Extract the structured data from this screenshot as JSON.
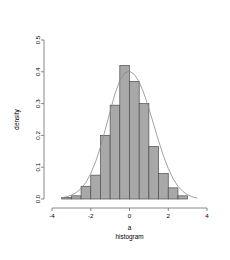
{
  "chart_data": {
    "type": "bar",
    "title": "Normal distribution",
    "subtitle": "",
    "xlabel": "a\nhistogram",
    "xlabel_lines": [
      "a",
      "histogram"
    ],
    "ylabel": "density",
    "xlim": [
      -4,
      4
    ],
    "ylim": [
      0.0,
      0.5
    ],
    "grid": false,
    "legend": false,
    "bin_width": 0.5,
    "bin_edges": [
      -3.5,
      -3.0,
      -2.5,
      -2.0,
      -1.5,
      -1.0,
      -0.5,
      0.0,
      0.5,
      1.0,
      1.5,
      2.0,
      2.5,
      3.0
    ],
    "categories": [
      "-3.5--3.0",
      "-3.0--2.5",
      "-2.5--2.0",
      "-2.0--1.5",
      "-1.5--1.0",
      "-1.0--0.5",
      "-0.5-0.0",
      "0.0-0.5",
      "0.5-1.0",
      "1.0-1.5",
      "1.5-2.0",
      "2.0-2.5",
      "2.5-3.0"
    ],
    "values": [
      0.005,
      0.01,
      0.04,
      0.075,
      0.2,
      0.295,
      0.42,
      0.37,
      0.3,
      0.165,
      0.08,
      0.035,
      0.01
    ],
    "x_ticks": [
      -4,
      -2,
      0,
      2,
      4
    ],
    "x_tick_labels": [
      "-4",
      "-2",
      "0",
      "2",
      "4"
    ],
    "y_ticks": [
      0.0,
      0.1,
      0.2,
      0.3,
      0.4,
      0.5
    ],
    "y_tick_labels": [
      "0.0",
      "0.1",
      "0.2",
      "0.3",
      "0.4",
      "0.5"
    ],
    "overlay": {
      "name": "density curve",
      "type": "line",
      "x": [
        -3.5,
        -3.25,
        -3.0,
        -2.75,
        -2.5,
        -2.25,
        -2.0,
        -1.75,
        -1.5,
        -1.25,
        -1.0,
        -0.75,
        -0.5,
        -0.25,
        0.0,
        0.25,
        0.5,
        0.75,
        1.0,
        1.25,
        1.5,
        1.75,
        2.0,
        2.25,
        2.5,
        2.75,
        3.0,
        3.25,
        3.5
      ],
      "y": [
        0.004,
        0.007,
        0.012,
        0.02,
        0.033,
        0.052,
        0.08,
        0.117,
        0.163,
        0.218,
        0.276,
        0.331,
        0.372,
        0.397,
        0.402,
        0.392,
        0.368,
        0.331,
        0.285,
        0.234,
        0.183,
        0.136,
        0.096,
        0.064,
        0.04,
        0.024,
        0.013,
        0.007,
        0.003
      ]
    },
    "colors": {
      "bar_fill": "#a8a8a8",
      "bar_border": "#4d4d4d",
      "curve": "#8c8c8c",
      "axis": "#6b6b6b",
      "text": "#000000",
      "background": "#ffffff"
    }
  }
}
